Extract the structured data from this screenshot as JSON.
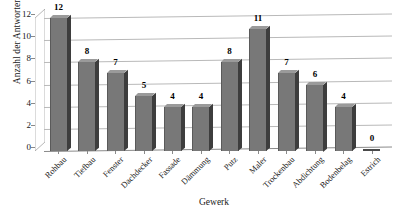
{
  "chart_data": {
    "type": "bar",
    "title": "",
    "subtitle": "",
    "xlabel": "Gewerk",
    "ylabel": "Anzahl der Antworten",
    "categories": [
      "Rohbau",
      "Tiefbau",
      "Fenster",
      "Dachdecker",
      "Fassade",
      "Dämmung",
      "Putz",
      "Maler",
      "Trockenbau",
      "Abdichtung",
      "Bodenbelag",
      "Estrich"
    ],
    "values": [
      12,
      8,
      7,
      5,
      4,
      4,
      8,
      11,
      7,
      6,
      4,
      0
    ],
    "data_labels": [
      "12",
      "8",
      "7",
      "5",
      "4",
      "4",
      "8",
      "11",
      "7",
      "6",
      "4",
      "0"
    ],
    "ylim": [
      0,
      12
    ],
    "ytick_values": [
      0,
      2,
      4,
      6,
      8,
      10,
      12
    ],
    "ytick_labels": [
      "0",
      "2",
      "4",
      "6",
      "8",
      "10",
      "12"
    ],
    "grid": true,
    "grid_axis": "y",
    "legend": false,
    "legend_position": "none",
    "bar_color": "#787878",
    "bar_side_color": "#3d3d3d",
    "bar_top_color": "#9a9a9a",
    "gridline_color": "#b9b9b9",
    "axis_color": "#8a8a8a",
    "text_color": "#1a1a1a",
    "background_color": "#ffffff",
    "three_d": true,
    "series": [
      {
        "name": "Anzahl der Antworten",
        "values": [
          12,
          8,
          7,
          5,
          4,
          4,
          8,
          11,
          7,
          6,
          4,
          0
        ]
      }
    ]
  }
}
